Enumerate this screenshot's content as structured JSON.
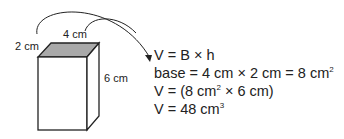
{
  "diagram": {
    "labels": {
      "depth": "2 cm",
      "width": "4 cm",
      "height": "6 cm"
    },
    "colors": {
      "top_face": "#a9a9a9",
      "outline": "#222222"
    }
  },
  "equations": [
    {
      "text": "V = B × h",
      "sup": ""
    },
    {
      "text": "base = 4 cm × 2 cm = 8 cm",
      "sup": "2"
    },
    {
      "text_a": "V = (8 cm",
      "sup": "2",
      "text_b": " × 6 cm)"
    },
    {
      "text": "V = 48 cm",
      "sup": "3"
    }
  ]
}
